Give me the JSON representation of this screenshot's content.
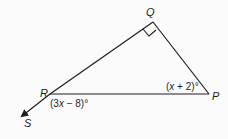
{
  "diagram": {
    "type": "triangle",
    "vertices": [
      {
        "name": "Q",
        "label": "Q"
      },
      {
        "name": "R",
        "label": "R"
      },
      {
        "name": "P",
        "label": "P"
      }
    ],
    "ray": {
      "from": "R",
      "to": "S",
      "label": "S"
    },
    "right_angle_at": "Q",
    "angle_labels": {
      "R": {
        "text": "(3x − 8)°",
        "parts": [
          "(3",
          "x",
          " − 8)°"
        ]
      },
      "P": {
        "text": "(x + 2)°",
        "parts": [
          "(",
          "x",
          " + 2)°"
        ]
      }
    },
    "colors": {
      "line": "#1e1e1e",
      "background": "#fbfbfb"
    }
  }
}
